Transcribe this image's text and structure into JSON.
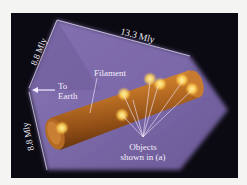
{
  "figure": {
    "type": "3D illustration of a galaxy filament in a survey box",
    "colors": {
      "background": "#0b0a12",
      "box_face": "#6e5c9c",
      "box_face_light": "#8877b6",
      "filament": "#b5661f",
      "filament_highlight": "#e8a24a",
      "object_glow": "#ffe27a",
      "lines": "#f2ecff"
    },
    "labels": {
      "length": "13.3 Mly",
      "height_top": "8.8 Mly",
      "height_bottom": "8.8 Mly",
      "to_earth_line1": "To",
      "to_earth_line2": "Earth",
      "filament": "Filament",
      "objects_line1": "Objects",
      "objects_line2": "shown in (a)"
    },
    "object_count": 7
  }
}
